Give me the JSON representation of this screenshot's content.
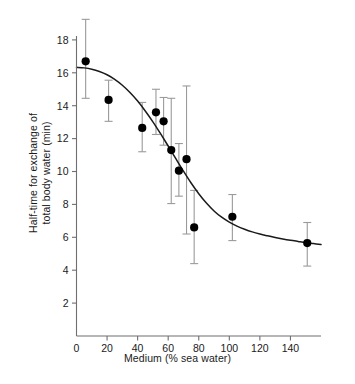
{
  "chart_data": {
    "type": "scatter",
    "title": "",
    "xlabel": "Medium (% sea water)",
    "ylabel": "Half-time for exchange of\ntotal body water (min)",
    "ylabel_line1": "Half-time for exchange of",
    "ylabel_line2": "total body water (min)",
    "xlim": [
      0,
      160
    ],
    "ylim": [
      0,
      19.4
    ],
    "xticks": [
      0,
      20,
      40,
      60,
      80,
      100,
      120,
      140
    ],
    "yticks": [
      2,
      4,
      6,
      8,
      10,
      12,
      14,
      16,
      18
    ],
    "xtick_labels": [
      "0",
      "20",
      "40",
      "60",
      "80",
      "100",
      "120",
      "140"
    ],
    "ytick_labels": [
      "2",
      "4",
      "6",
      "8",
      "10",
      "12",
      "14",
      "16",
      "18"
    ],
    "grid": false,
    "legend": null,
    "marker": "filled-circle",
    "marker_color": "#000000",
    "errorbar_color": "#9a9a9a",
    "line_color": "#1a1a1a",
    "axis_color": "#6f6f6f",
    "points": [
      {
        "x": 6,
        "y": 16.7,
        "yerr_low": 14.45,
        "yerr_high": 19.25
      },
      {
        "x": 21,
        "y": 14.35,
        "yerr_low": 13.05,
        "yerr_high": 15.55
      },
      {
        "x": 43,
        "y": 12.65,
        "yerr_low": 11.2,
        "yerr_high": 14.2
      },
      {
        "x": 52,
        "y": 13.6,
        "yerr_low": 12.25,
        "yerr_high": 15.0
      },
      {
        "x": 57,
        "y": 13.05,
        "yerr_low": 11.6,
        "yerr_high": 14.5
      },
      {
        "x": 62,
        "y": 11.3,
        "yerr_low": 8.05,
        "yerr_high": 14.45
      },
      {
        "x": 67,
        "y": 10.05,
        "yerr_low": 8.5,
        "yerr_high": 11.7
      },
      {
        "x": 72,
        "y": 10.75,
        "yerr_low": 6.2,
        "yerr_high": 15.2
      },
      {
        "x": 77,
        "y": 6.6,
        "yerr_low": 4.4,
        "yerr_high": 8.85
      },
      {
        "x": 102,
        "y": 7.25,
        "yerr_low": 5.8,
        "yerr_high": 8.6
      },
      {
        "x": 151,
        "y": 5.65,
        "yerr_low": 4.25,
        "yerr_high": 6.9
      }
    ],
    "fit_curve": {
      "description": "sigmoid fit",
      "points": [
        {
          "x": 0,
          "y": 16.33
        },
        {
          "x": 5,
          "y": 16.3
        },
        {
          "x": 10,
          "y": 16.22
        },
        {
          "x": 15,
          "y": 16.08
        },
        {
          "x": 20,
          "y": 15.88
        },
        {
          "x": 25,
          "y": 15.6
        },
        {
          "x": 30,
          "y": 15.24
        },
        {
          "x": 35,
          "y": 14.8
        },
        {
          "x": 40,
          "y": 14.28
        },
        {
          "x": 45,
          "y": 13.68
        },
        {
          "x": 50,
          "y": 13.02
        },
        {
          "x": 55,
          "y": 12.3
        },
        {
          "x": 60,
          "y": 11.55
        },
        {
          "x": 65,
          "y": 10.78
        },
        {
          "x": 70,
          "y": 10.02
        },
        {
          "x": 75,
          "y": 9.3
        },
        {
          "x": 80,
          "y": 8.65
        },
        {
          "x": 85,
          "y": 8.08
        },
        {
          "x": 90,
          "y": 7.6
        },
        {
          "x": 95,
          "y": 7.22
        },
        {
          "x": 100,
          "y": 6.92
        },
        {
          "x": 105,
          "y": 6.68
        },
        {
          "x": 110,
          "y": 6.49
        },
        {
          "x": 115,
          "y": 6.33
        },
        {
          "x": 120,
          "y": 6.2
        },
        {
          "x": 125,
          "y": 6.09
        },
        {
          "x": 130,
          "y": 5.99
        },
        {
          "x": 135,
          "y": 5.9
        },
        {
          "x": 140,
          "y": 5.82
        },
        {
          "x": 145,
          "y": 5.75
        },
        {
          "x": 150,
          "y": 5.68
        },
        {
          "x": 155,
          "y": 5.62
        },
        {
          "x": 160,
          "y": 5.56
        }
      ]
    }
  }
}
